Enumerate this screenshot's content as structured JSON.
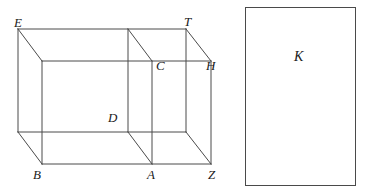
{
  "figure": {
    "caption": "",
    "stroke_color": "#4a4a4a",
    "label_color": "#1a1a1a",
    "background_color": "#ffffff",
    "stroke_width": 1
  },
  "solid": {
    "name": "rectangular-prism-with-internal-cross-section",
    "vertex_labels": [
      {
        "id": "E",
        "text": "E",
        "x": 14,
        "y": 16
      },
      {
        "id": "T",
        "text": "T",
        "x": 184,
        "y": 15
      },
      {
        "id": "C",
        "text": "C",
        "x": 156,
        "y": 59
      },
      {
        "id": "H",
        "text": "H",
        "x": 206,
        "y": 59
      },
      {
        "id": "D",
        "text": "D",
        "x": 108,
        "y": 111
      },
      {
        "id": "B",
        "text": "B",
        "x": 33,
        "y": 168
      },
      {
        "id": "A",
        "text": "A",
        "x": 147,
        "y": 168
      },
      {
        "id": "Z",
        "text": "Z",
        "x": 208,
        "y": 168
      }
    ],
    "geometry": {
      "back_face": {
        "left": 18,
        "top": 29,
        "right": 186,
        "bottom": 132
      },
      "front_face": {
        "left": 42,
        "top": 61,
        "right": 211,
        "bottom": 164
      },
      "cut_plane_back_x": 128,
      "cut_plane_front_x": 152
    }
  },
  "region": {
    "name": "rectangle-K",
    "label": "K",
    "label_x": 294,
    "label_y": 50,
    "rect": {
      "left": 245,
      "top": 7,
      "right": 356,
      "bottom": 186
    }
  }
}
